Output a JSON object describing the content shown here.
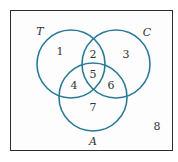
{
  "diagram": {
    "type": "venn-3-set",
    "stroke_color": "#2a7a96",
    "frame_color": "#2b2b2b",
    "sets": [
      {
        "name": "T",
        "label": "T",
        "cx": 71,
        "cy": 64,
        "r": 34,
        "label_x": 40,
        "label_y": 31
      },
      {
        "name": "C",
        "label": "C",
        "cx": 116,
        "cy": 64,
        "r": 34,
        "label_x": 147,
        "label_y": 32
      },
      {
        "name": "A",
        "label": "A",
        "cx": 93,
        "cy": 97,
        "r": 34,
        "label_x": 93,
        "label_y": 141
      }
    ],
    "regions": [
      {
        "id": "1",
        "label": "1",
        "x": 60,
        "y": 51
      },
      {
        "id": "2",
        "label": "2",
        "x": 93,
        "y": 54
      },
      {
        "id": "3",
        "label": "3",
        "x": 126,
        "y": 54
      },
      {
        "id": "4",
        "label": "4",
        "x": 74,
        "y": 85
      },
      {
        "id": "5",
        "label": "5",
        "x": 93,
        "y": 74
      },
      {
        "id": "6",
        "label": "6",
        "x": 111,
        "y": 85
      },
      {
        "id": "7",
        "label": "7",
        "x": 93,
        "y": 107
      },
      {
        "id": "8",
        "label": "8",
        "x": 157,
        "y": 126
      }
    ]
  }
}
